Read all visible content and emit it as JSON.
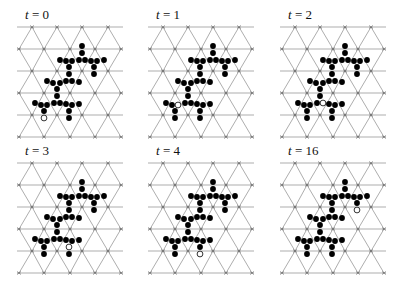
{
  "figure": {
    "grid": {
      "row_y": [
        27,
        49,
        71,
        93,
        115,
        137
      ],
      "even_row_x": [
        32,
        57,
        82,
        108
      ],
      "odd_row_x": [
        19,
        44,
        70,
        95,
        121
      ],
      "line_x_min": 17,
      "line_x_max": 123,
      "line_color": "#8a8a8a",
      "mark_color": "#555555"
    },
    "dot_color": "#000000",
    "dot_radius": 2.9,
    "shape_dots": [
      [
        82,
        46
      ],
      [
        82,
        53
      ],
      [
        60,
        60
      ],
      [
        66,
        61
      ],
      [
        72,
        61
      ],
      [
        79,
        60
      ],
      [
        85,
        60
      ],
      [
        91,
        61
      ],
      [
        97,
        61
      ],
      [
        104,
        60
      ],
      [
        69,
        67
      ],
      [
        94,
        67
      ],
      [
        69,
        74
      ],
      [
        94,
        74
      ],
      [
        47,
        81
      ],
      [
        53,
        83
      ],
      [
        60,
        83
      ],
      [
        66,
        81
      ],
      [
        72,
        81
      ],
      [
        79,
        82
      ],
      [
        57,
        89
      ],
      [
        57,
        96
      ],
      [
        35,
        103
      ],
      [
        41,
        105
      ],
      [
        47,
        105
      ],
      [
        54,
        103
      ],
      [
        60,
        103
      ],
      [
        66,
        104
      ],
      [
        72,
        105
      ],
      [
        79,
        104
      ],
      [
        44,
        111
      ],
      [
        69,
        111
      ],
      [
        44,
        118
      ],
      [
        69,
        118
      ]
    ],
    "panels": [
      {
        "label_var": "t",
        "label_eq": " = ",
        "label_val": "0",
        "offset": [
          0,
          0
        ],
        "hollow": [
          44,
          118
        ]
      },
      {
        "label_var": "t",
        "label_eq": " = ",
        "label_val": "1",
        "offset": [
          131,
          0
        ],
        "hollow": [
          47,
          105
        ]
      },
      {
        "label_var": "t",
        "label_eq": " = ",
        "label_val": "2",
        "offset": [
          263,
          0
        ],
        "hollow": [
          60,
          103
        ]
      },
      {
        "label_var": "t",
        "label_eq": " = ",
        "label_val": "3",
        "offset": [
          0,
          136
        ],
        "hollow": [
          69,
          111
        ]
      },
      {
        "label_var": "t",
        "label_eq": " = ",
        "label_val": "4",
        "offset": [
          131,
          136
        ],
        "hollow": [
          69,
          118
        ]
      },
      {
        "label_var": "t",
        "label_eq": " = ",
        "label_val": "16",
        "offset": [
          263,
          136
        ],
        "hollow": [
          94,
          74
        ]
      }
    ]
  }
}
